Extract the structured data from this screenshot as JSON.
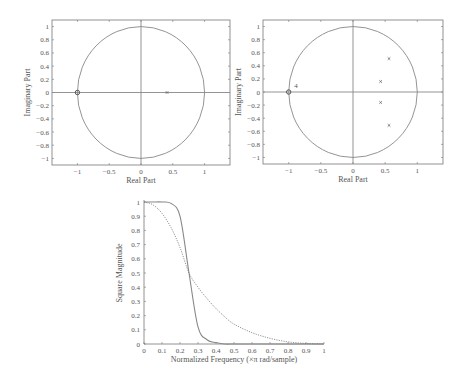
{
  "chart_data": [
    {
      "type": "scatter",
      "title": "",
      "xlabel": "Real Part",
      "ylabel": "Imaginary Part",
      "xlim": [
        -1.4,
        1.4
      ],
      "ylim": [
        -1.1,
        1.1
      ],
      "xticks": [
        "-1",
        "-0.5",
        "0",
        "0.5",
        "1"
      ],
      "yticks": [
        "1",
        "0.8",
        "0.6",
        "0.4",
        "0.2",
        "0",
        "-0.2",
        "-0.4",
        "-0.6",
        "-0.8",
        "-1"
      ],
      "unit_circle": true,
      "zeros": [
        {
          "re": -1.0,
          "im": 0.0
        }
      ],
      "poles": [
        {
          "re": 0.41,
          "im": 0.0
        }
      ],
      "annotations": []
    },
    {
      "type": "scatter",
      "title": "",
      "xlabel": "Real Part",
      "ylabel": "Imaginary Part",
      "xlim": [
        -1.4,
        1.4
      ],
      "ylim": [
        -1.1,
        1.1
      ],
      "xticks": [
        "-1",
        "-0.5",
        "0",
        "0.5",
        "1"
      ],
      "yticks": [
        "1",
        "0.8",
        "0.6",
        "0.4",
        "0.2",
        "0",
        "-0.2",
        "-0.4",
        "-0.6",
        "-0.8",
        "-1"
      ],
      "unit_circle": true,
      "zeros": [
        {
          "re": -1.0,
          "im": 0.0,
          "multiplicity": 4
        }
      ],
      "poles": [
        {
          "re": 0.56,
          "im": 0.51
        },
        {
          "re": 0.43,
          "im": 0.16
        },
        {
          "re": 0.43,
          "im": -0.16
        },
        {
          "re": 0.56,
          "im": -0.51
        }
      ],
      "annotations": [
        {
          "text": "4",
          "re": -0.93,
          "im": 0.06
        }
      ]
    },
    {
      "type": "line",
      "title": "",
      "xlabel": "Normalized Frequency (×π rad/sample)",
      "ylabel": "Square Magnitude",
      "xlim": [
        0,
        1
      ],
      "ylim": [
        0,
        1
      ],
      "xticks": [
        "0",
        "0.1",
        "0.2",
        "0.3",
        "0.4",
        "0.5",
        "0.6",
        "0.7",
        "0.8",
        "0.9",
        "1"
      ],
      "yticks": [
        "1",
        "0.9",
        "0.8",
        "0.7",
        "0.6",
        "0.5",
        "0.4",
        "0.3",
        "0.2",
        "0.1",
        "0"
      ],
      "x": [
        0,
        0.05,
        0.1,
        0.15,
        0.2,
        0.25,
        0.3,
        0.35,
        0.4,
        0.45,
        0.5,
        0.6,
        0.7,
        0.8,
        0.9,
        1.0
      ],
      "series": [
        {
          "name": "4th-order filter (solid)",
          "style": "solid",
          "values": [
            1.0,
            1.0,
            1.0,
            0.99,
            0.9,
            0.5,
            0.12,
            0.03,
            0.01,
            0.0,
            0.0,
            0.0,
            0.0,
            0.0,
            0.0,
            0.0
          ]
        },
        {
          "name": "1st-order filter (dotted)",
          "style": "dotted",
          "values": [
            1.0,
            0.98,
            0.92,
            0.82,
            0.68,
            0.5,
            0.4,
            0.32,
            0.25,
            0.19,
            0.14,
            0.08,
            0.04,
            0.015,
            0.004,
            0.0
          ]
        }
      ],
      "annotations": [
        {
          "text": "curves intersect near (0.25, 0.5)"
        }
      ]
    }
  ]
}
